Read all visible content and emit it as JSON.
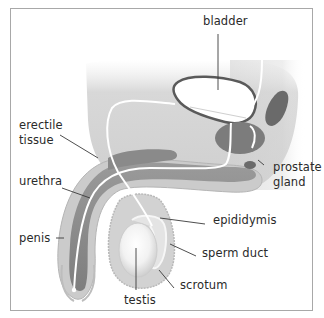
{
  "diagram": {
    "type": "anatomical illustration",
    "labels": [
      {
        "id": "bladder",
        "text": "bladder"
      },
      {
        "id": "erectile-tissue",
        "text": "erectile\ntissue"
      },
      {
        "id": "prostate-gland",
        "text": "prostate\ngland"
      },
      {
        "id": "urethra",
        "text": "urethra"
      },
      {
        "id": "epididymis",
        "text": "epididymis"
      },
      {
        "id": "penis",
        "text": "penis"
      },
      {
        "id": "sperm-duct",
        "text": "sperm duct"
      },
      {
        "id": "scrotum",
        "text": "scrotum"
      },
      {
        "id": "testis",
        "text": "testis"
      }
    ],
    "colors": {
      "body": "#d4d4d4",
      "body_shadow": "#b4b4b4",
      "tissue": "#8c8c8c",
      "tissue_dark": "#6e6e6e",
      "organ_outline": "#555555",
      "duct": "#ffffff",
      "leader": "#3a3a3a",
      "frame": "#a8a8a8"
    }
  }
}
